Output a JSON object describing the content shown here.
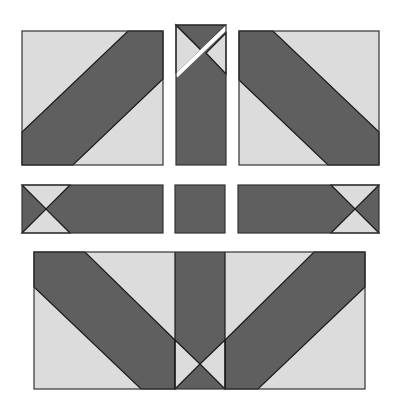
{
  "colors": {
    "background": "#ffffff",
    "light": "#dcdcdc",
    "dark": "#5f5f5f",
    "stroke": "#1a1a1a",
    "cut": "#ffffff"
  },
  "pieces": {
    "top_left": {
      "label": "Top-left square with diagonal band"
    },
    "top_middle": {
      "label": "Top-middle vertical strip with cut"
    },
    "top_right": {
      "label": "Top-right square with diagonal band"
    },
    "middle_left": {
      "label": "Middle-left bar"
    },
    "middle_center": {
      "label": "Middle-center square"
    },
    "middle_right": {
      "label": "Middle-right bar"
    },
    "bottom": {
      "label": "Assembled bottom panel"
    }
  }
}
